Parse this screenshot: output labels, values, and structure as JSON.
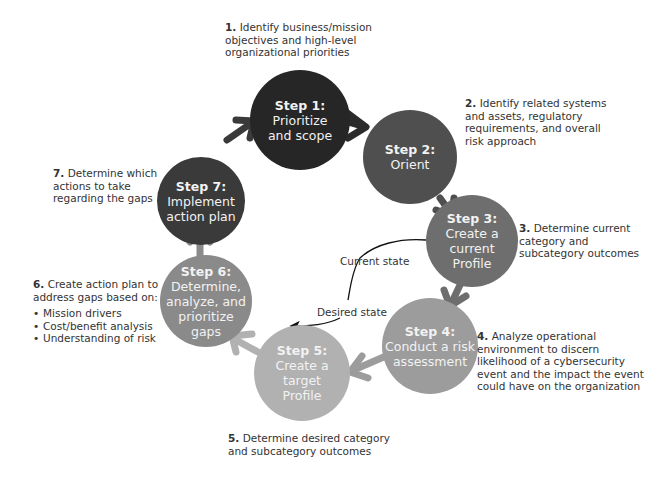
{
  "colors": {
    "step1": "#262626",
    "step2": "#4f4f4f",
    "step3": "#6e6e6e",
    "step4": "#9c9c9c",
    "step5": "#b1b1b1",
    "step6": "#8a8a8a",
    "step7": "#3a3a3a"
  },
  "steps": [
    {
      "step": "Step 1:",
      "label_lines": [
        "Prioritize",
        "and scope"
      ]
    },
    {
      "step": "Step 2:",
      "label_lines": [
        "Orient"
      ]
    },
    {
      "step": "Step 3:",
      "label_lines": [
        "Create a",
        "current",
        "Profile"
      ]
    },
    {
      "step": "Step 4:",
      "label_lines": [
        "Conduct a risk",
        "assessment"
      ]
    },
    {
      "step": "Step 5:",
      "label_lines": [
        "Create a",
        "target",
        "Profile"
      ]
    },
    {
      "step": "Step 6:",
      "label_lines": [
        "Determine,",
        "analyze, and",
        "prioritize",
        "gaps"
      ]
    },
    {
      "step": "Step 7:",
      "label_lines": [
        "Implement",
        "action plan"
      ]
    }
  ],
  "notes": [
    {
      "num": "1.",
      "lines": [
        "Identify business/mission",
        "objectives and high-level",
        "organizational priorities"
      ]
    },
    {
      "num": "2.",
      "lines": [
        "Identify related systems",
        "and assets, regulatory",
        "requirements, and overall",
        "risk approach"
      ]
    },
    {
      "num": "3.",
      "lines": [
        "Determine current",
        "category and",
        "subcategory outcomes"
      ]
    },
    {
      "num": "4.",
      "lines": [
        "Analyze operational",
        "environment to discern",
        "likelihood of a cybersecurity",
        "event and the impact the event",
        "could have on the organization"
      ]
    },
    {
      "num": "5.",
      "lines": [
        "Determine desired category",
        "and subcategory outcomes"
      ]
    },
    {
      "num": "6.",
      "lines": [
        "Create action plan to",
        "address gaps based on:"
      ],
      "bullets": [
        "Mission drivers",
        "Cost/benefit analysis",
        "Understanding of risk"
      ]
    },
    {
      "num": "7.",
      "lines": [
        "Determine which",
        "actions to take",
        "regarding the gaps"
      ]
    }
  ],
  "states": {
    "current": "Current state",
    "desired": "Desired state"
  }
}
